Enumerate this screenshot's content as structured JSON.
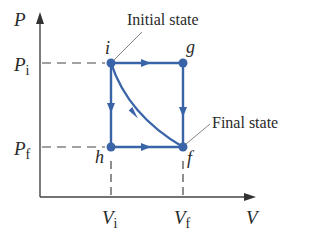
{
  "diagram": {
    "axes": {
      "y_label": "P",
      "x_label": "V"
    },
    "ticks": {
      "p_initial": {
        "main": "P",
        "sub": "i"
      },
      "p_final": {
        "main": "P",
        "sub": "f"
      },
      "v_initial": {
        "main": "V",
        "sub": "i"
      },
      "v_final": {
        "main": "V",
        "sub": "f"
      }
    },
    "points": {
      "i": "i",
      "g": "g",
      "h": "h",
      "f": "f"
    },
    "annotations": {
      "initial": "Initial state",
      "final": "Final state"
    },
    "colors": {
      "path": "#3a64a8",
      "axis": "#333333",
      "text": "#2a2a2a"
    }
  }
}
